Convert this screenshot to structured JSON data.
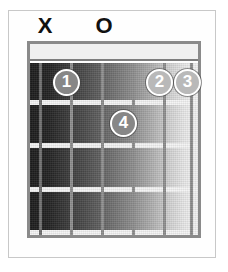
{
  "diagram": {
    "type": "chord-chart",
    "strings_count": 6,
    "frets_count": 4,
    "nut_shown": true,
    "colors": {
      "frame": "#c8c8c8",
      "board_outline": "#8a8a8a",
      "nut": "#f0f0f0",
      "string": "#8e8e8e",
      "fret": "#f4f4f4",
      "dot_fill": "#9b9b9b",
      "dot_ring": "#ffffff",
      "dot_text": "#ffffff",
      "marker_text": "#111111",
      "background": "#ffffff"
    }
  },
  "open_markers": [
    {
      "symbol": "X",
      "string": 6,
      "meaning": "muted-string",
      "x": 26,
      "y": 0
    },
    {
      "symbol": "O",
      "string": 4,
      "meaning": "open-string",
      "x": 85,
      "y": 0
    }
  ],
  "finger_dots": [
    {
      "label": "1",
      "finger": "index",
      "string": 5,
      "fret": 1,
      "cx": 66,
      "cy": 82,
      "shade": "mid"
    },
    {
      "label": "2",
      "finger": "middle",
      "string": 2,
      "fret": 1,
      "cx": 159,
      "cy": 82,
      "shade": "light"
    },
    {
      "label": "3",
      "finger": "ring",
      "string": 1,
      "fret": 1,
      "cx": 187,
      "cy": 82,
      "shade": "light"
    },
    {
      "label": "4",
      "finger": "pinky",
      "string": 3,
      "fret": 2,
      "cx": 123,
      "cy": 123,
      "shade": "mid"
    }
  ],
  "string_positions_px": [
    12,
    43,
    74,
    105,
    136,
    162
  ],
  "fret_positions_px": [
    59,
    102,
    146,
    189
  ]
}
